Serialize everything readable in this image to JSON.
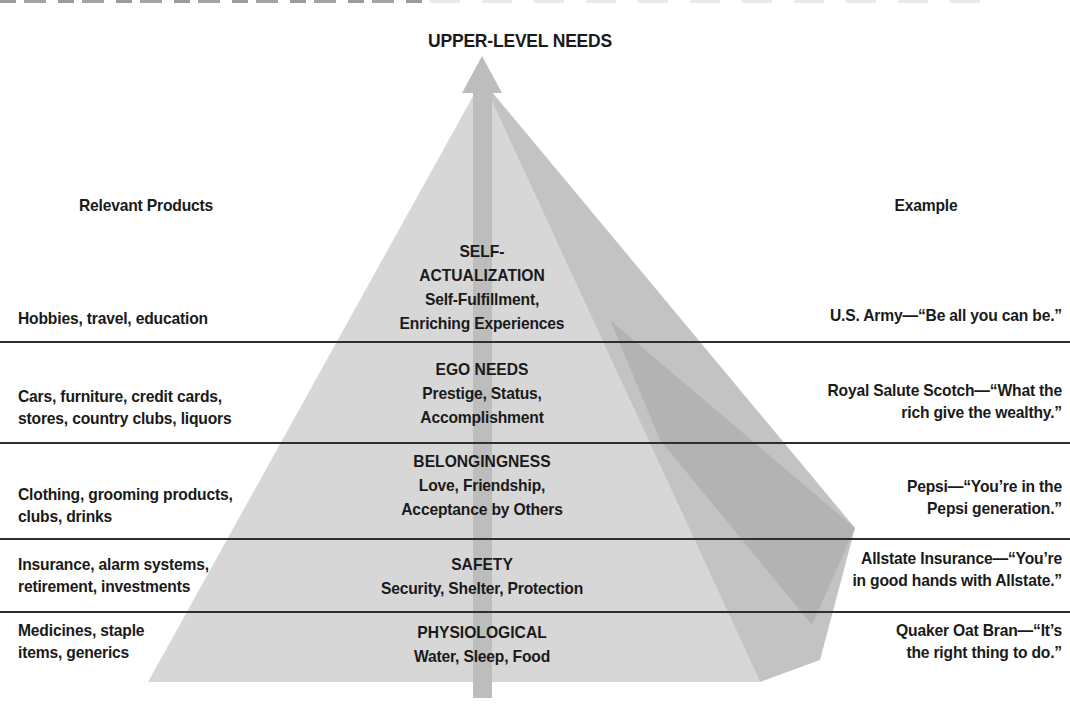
{
  "title": "UPPER-LEVEL NEEDS",
  "column_headers": {
    "products": "Relevant Products",
    "example": "Example"
  },
  "levels": [
    {
      "name": [
        "SELF-",
        "ACTUALIZATION"
      ],
      "description": [
        "Self-Fulfillment,",
        "Enriching Experiences"
      ],
      "products": [
        "Hobbies, travel, education"
      ],
      "example": [
        "U.S. Army—“Be all you can be.”"
      ]
    },
    {
      "name": [
        "EGO NEEDS"
      ],
      "description": [
        "Prestige, Status,",
        "Accomplishment"
      ],
      "products": [
        "Cars, furniture, credit cards,",
        "stores, country clubs, liquors"
      ],
      "example": [
        "Royal Salute Scotch—“What the",
        "rich give the wealthy.”"
      ]
    },
    {
      "name": [
        "BELONGINGNESS"
      ],
      "description": [
        "Love, Friendship,",
        "Acceptance by Others"
      ],
      "products": [
        "Clothing, grooming products,",
        "clubs, drinks"
      ],
      "example": [
        "Pepsi—“You’re in the",
        "Pepsi generation.”"
      ]
    },
    {
      "name": [
        "SAFETY"
      ],
      "description": [
        "Security, Shelter, Protection"
      ],
      "products": [
        "Insurance, alarm systems,",
        "retirement, investments"
      ],
      "example": [
        "Allstate Insurance—“You’re",
        "in good hands with Allstate.”"
      ]
    },
    {
      "name": [
        "PHYSIOLOGICAL"
      ],
      "description": [
        "Water, Sleep, Food"
      ],
      "products": [
        "Medicines, staple",
        "items, generics"
      ],
      "example": [
        "Quaker Oat Bran—“It’s",
        "the right thing to do.”"
      ]
    }
  ],
  "colors": {
    "pyramid-face": "#d7d7d7",
    "pyramid-side": "#c3c3c3",
    "arrow": "#bdbdbd",
    "separator": "#2e2e2e",
    "text": "#1a1a1a"
  }
}
